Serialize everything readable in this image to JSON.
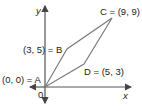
{
  "diagram": {
    "type": "coordinate-plane-parallelogram",
    "axes": {
      "x_label": "x",
      "y_label": "y",
      "origin_label": "0"
    },
    "points": [
      {
        "name": "A",
        "label": "(0, 0) = A",
        "x": 0,
        "y": 0
      },
      {
        "name": "B",
        "label": "(3, 5) = B",
        "x": 3,
        "y": 5
      },
      {
        "name": "C",
        "label": "C = (9, 9)",
        "x": 9,
        "y": 9
      },
      {
        "name": "D",
        "label": "D = (5, 3)",
        "x": 5,
        "y": 3
      }
    ],
    "colors": {
      "axis": "#555555",
      "shape": "#777777",
      "text": "#222222"
    }
  }
}
